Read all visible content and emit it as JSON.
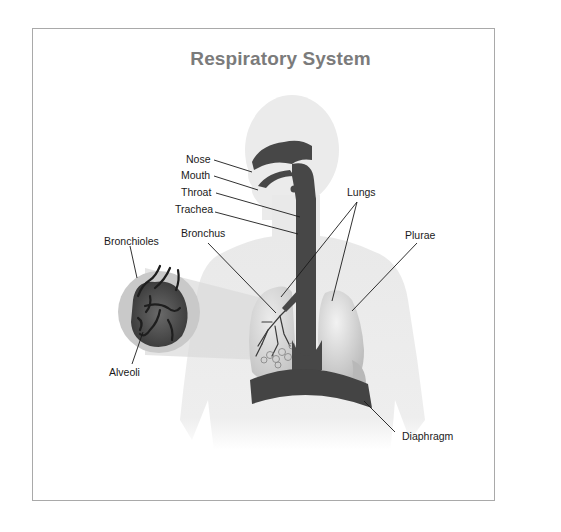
{
  "title": "Respiratory System",
  "labels": {
    "nose": "Nose",
    "mouth": "Mouth",
    "throat": "Throat",
    "trachea": "Trachea",
    "bronchus": "Bronchus",
    "bronchioles": "Bronchioles",
    "alveoli": "Alveoli",
    "lungs": "Lungs",
    "plurae": "Plurae",
    "diaphragm": "Diaphragm"
  },
  "colors": {
    "body": "#ececec",
    "airway": "#4a4a4a",
    "lung_right": "#dcdcdc",
    "lung_left": "#d2d2d2",
    "diaphragm": "#3f3f3f",
    "leader": "#1a1a1a",
    "title": "#7b7b7b"
  }
}
